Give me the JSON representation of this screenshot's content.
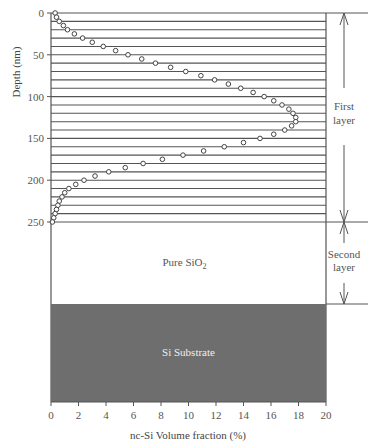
{
  "chart_data": {
    "type": "scatter",
    "title": "",
    "xlabel": "nc-Si Volume fraction (%)",
    "ylabel": "Depth (nm)",
    "xlim": [
      0,
      20
    ],
    "ylim": [
      0,
      250
    ],
    "y_inverted": true,
    "x_ticks": [
      0,
      2,
      4,
      6,
      8,
      10,
      12,
      14,
      16,
      18,
      20
    ],
    "y_ticks": [
      0,
      50,
      100,
      150,
      200,
      250
    ],
    "grid": {
      "horizontal_lines_every_nm": 10,
      "vertical": false
    },
    "marker": "open-circle",
    "series": [
      {
        "name": "nc-Si volume fraction profile",
        "points": [
          {
            "depth": 0,
            "x": 0.3
          },
          {
            "depth": 5,
            "x": 0.4
          },
          {
            "depth": 10,
            "x": 0.6
          },
          {
            "depth": 15,
            "x": 0.9
          },
          {
            "depth": 20,
            "x": 1.2
          },
          {
            "depth": 25,
            "x": 1.7
          },
          {
            "depth": 30,
            "x": 2.3
          },
          {
            "depth": 35,
            "x": 3.0
          },
          {
            "depth": 40,
            "x": 3.8
          },
          {
            "depth": 45,
            "x": 4.7
          },
          {
            "depth": 50,
            "x": 5.6
          },
          {
            "depth": 55,
            "x": 6.6
          },
          {
            "depth": 60,
            "x": 7.6
          },
          {
            "depth": 65,
            "x": 8.7
          },
          {
            "depth": 70,
            "x": 9.8
          },
          {
            "depth": 75,
            "x": 10.9
          },
          {
            "depth": 80,
            "x": 11.9
          },
          {
            "depth": 85,
            "x": 12.9
          },
          {
            "depth": 90,
            "x": 13.8
          },
          {
            "depth": 95,
            "x": 14.7
          },
          {
            "depth": 100,
            "x": 15.5
          },
          {
            "depth": 105,
            "x": 16.2
          },
          {
            "depth": 110,
            "x": 16.8
          },
          {
            "depth": 115,
            "x": 17.3
          },
          {
            "depth": 120,
            "x": 17.6
          },
          {
            "depth": 125,
            "x": 17.8
          },
          {
            "depth": 130,
            "x": 17.8
          },
          {
            "depth": 135,
            "x": 17.5
          },
          {
            "depth": 140,
            "x": 17.0
          },
          {
            "depth": 145,
            "x": 16.2
          },
          {
            "depth": 150,
            "x": 15.2
          },
          {
            "depth": 155,
            "x": 14.0
          },
          {
            "depth": 160,
            "x": 12.6
          },
          {
            "depth": 165,
            "x": 11.1
          },
          {
            "depth": 170,
            "x": 9.6
          },
          {
            "depth": 175,
            "x": 8.1
          },
          {
            "depth": 180,
            "x": 6.7
          },
          {
            "depth": 185,
            "x": 5.4
          },
          {
            "depth": 190,
            "x": 4.2
          },
          {
            "depth": 195,
            "x": 3.2
          },
          {
            "depth": 200,
            "x": 2.4
          },
          {
            "depth": 205,
            "x": 1.8
          },
          {
            "depth": 210,
            "x": 1.3
          },
          {
            "depth": 215,
            "x": 1.0
          },
          {
            "depth": 220,
            "x": 0.8
          },
          {
            "depth": 225,
            "x": 0.6
          },
          {
            "depth": 230,
            "x": 0.5
          },
          {
            "depth": 235,
            "x": 0.4
          },
          {
            "depth": 240,
            "x": 0.3
          },
          {
            "depth": 245,
            "x": 0.2
          },
          {
            "depth": 250,
            "x": 0.1
          }
        ]
      }
    ],
    "regions": [
      {
        "name": "First layer",
        "label_lines": [
          "First",
          "layer"
        ],
        "depth_range": [
          0,
          250
        ]
      },
      {
        "name": "Second layer",
        "label_lines": [
          "Second",
          "layer"
        ],
        "content_label": "Pure SiO",
        "content_subscript": "2"
      },
      {
        "name": "Si Substrate",
        "content_label": "Si Substrate",
        "fill": "#6e6e6e"
      }
    ]
  },
  "colors": {
    "line": "#555555",
    "marker": "#444444",
    "substrate": "#6e6e6e",
    "substrate_text": "#eeeeee"
  }
}
